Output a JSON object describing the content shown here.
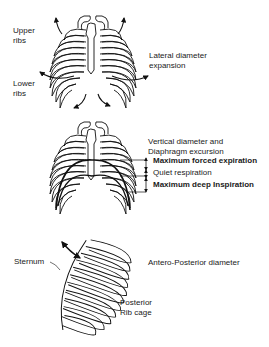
{
  "figure": {
    "panels": [
      {
        "id": "frontal-lateral",
        "labels": {
          "upper_ribs_1": "Upper",
          "upper_ribs_2": "ribs",
          "lower_ribs_1": "Lower",
          "lower_ribs_2": "ribs",
          "caption_1": "Lateral diameter",
          "caption_2": "expansion"
        }
      },
      {
        "id": "frontal-vertical",
        "labels": {
          "caption_1": "Vertical diameter  and",
          "caption_2": "Diaphragm excursion",
          "level_1": "Maximum forced expiration",
          "level_2": "Quiet  respiration",
          "level_3": "Maximum deep Inspiration"
        }
      },
      {
        "id": "lateral-ap",
        "labels": {
          "sternum": "Sternum",
          "caption": "Antero-Posterior diameter",
          "posterior_1": "Posterior",
          "posterior_2": "Rib cage"
        }
      }
    ],
    "colors": {
      "ink": "#111111",
      "background": "#ffffff"
    }
  }
}
